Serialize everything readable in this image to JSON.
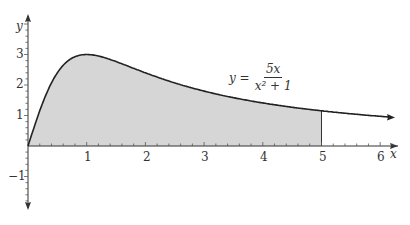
{
  "chart_data": {
    "type": "area",
    "title": "",
    "function": "y = 5x/(x^2+1)",
    "xlabel": "x",
    "ylabel": "y",
    "xlim": [
      0,
      6.3
    ],
    "ylim": [
      -1.9,
      4.2
    ],
    "x_ticks": [
      "1",
      "2",
      "3",
      "4",
      "5",
      "6"
    ],
    "y_ticks": [
      "3",
      "2",
      "1",
      "−1"
    ],
    "shaded_region": {
      "from": 0,
      "to": 5,
      "color": "#d6d6d6"
    },
    "x": [
      0,
      0.25,
      0.5,
      0.75,
      1,
      1.5,
      2,
      2.5,
      3,
      3.5,
      4,
      4.5,
      5,
      5.5,
      6.2
    ],
    "values": [
      0,
      1.18,
      2.0,
      2.4,
      2.5,
      2.31,
      2.0,
      1.72,
      1.5,
      1.32,
      1.18,
      1.06,
      0.96,
      0.88,
      0.79
    ],
    "annotation": {
      "lhs": "y =",
      "numerator": "5x",
      "denominator": "x² + 1"
    },
    "grid": false,
    "legend": null
  },
  "labels": {
    "x_axis": "x",
    "y_axis": "y",
    "x_ticks": [
      "1",
      "2",
      "3",
      "4",
      "5",
      "6"
    ],
    "y_ticks": [
      "3",
      "2",
      "1",
      "−1"
    ],
    "eq_lhs": "y =",
    "eq_num": "5x",
    "eq_den": "x² + 1"
  }
}
